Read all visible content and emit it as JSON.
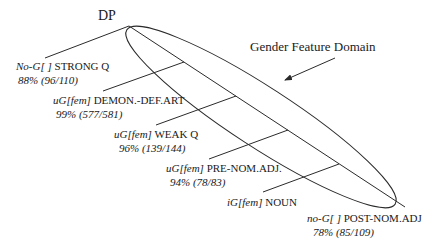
{
  "root": {
    "label": "DP"
  },
  "domain": {
    "label": "Gender Feature Domain"
  },
  "nodes": [
    {
      "feature": "No-G[ ]",
      "category": "STRONG Q",
      "stat": "88% (96/110)"
    },
    {
      "feature": "uG[fem]",
      "category": "DEMON.-DEF.ART",
      "stat": "99% (577/581)"
    },
    {
      "feature": "uG[fem]",
      "category": "WEAK Q",
      "stat": "96% (139/144)"
    },
    {
      "feature": "uG[fem]",
      "category": "PRE-NOM.ADJ.",
      "stat": "94% (78/83)"
    },
    {
      "feature": "iG[fem]",
      "category": "NOUN",
      "stat": ""
    },
    {
      "feature": "no-G[ ]",
      "category": "POST-NOM.ADJ",
      "stat": "78% (85/109)"
    }
  ],
  "colors": {
    "line": "#2a2a2a",
    "text": "#1a1a1a"
  }
}
